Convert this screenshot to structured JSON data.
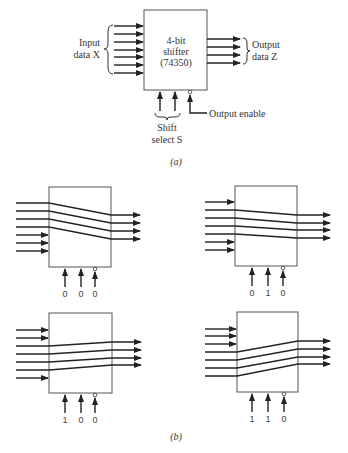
{
  "part_a": {
    "chip_label_line1": "4-bit",
    "chip_label_line2": "shifter",
    "chip_label_line3": "(74350)",
    "input_label_line1": "Input",
    "input_label_line2": "data X",
    "output_label_line1": "Output",
    "output_label_line2": "data Z",
    "shift_label_line1": "Shift",
    "shift_label_line2": "select S",
    "enable_label": "Output enable",
    "caption": "(a)",
    "input_count": 7,
    "output_count": 4
  },
  "part_b": {
    "caption": "(b)",
    "panels": [
      {
        "position": "top-left",
        "select": [
          "0",
          "0",
          "0"
        ],
        "shift": 0
      },
      {
        "position": "top-right",
        "select": [
          "0",
          "1",
          "0"
        ],
        "shift": 1
      },
      {
        "position": "bottom-left",
        "select": [
          "1",
          "0",
          "0"
        ],
        "shift": 2
      },
      {
        "position": "bottom-right",
        "select": [
          "1",
          "1",
          "0"
        ],
        "shift": 3
      }
    ]
  }
}
